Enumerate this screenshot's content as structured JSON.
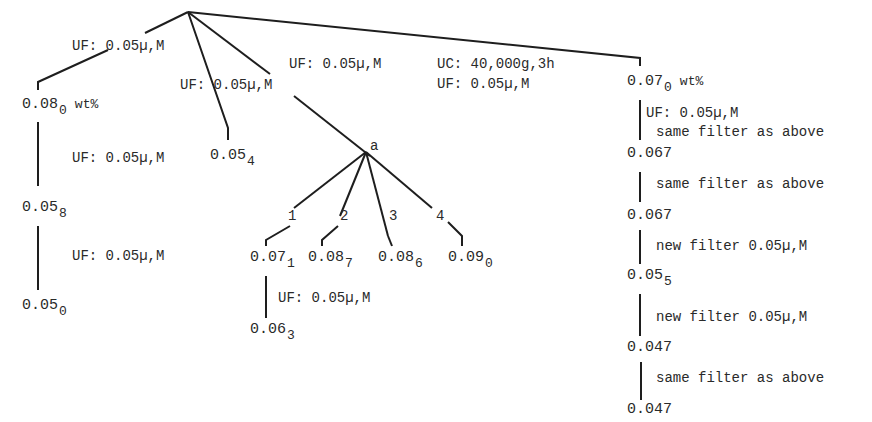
{
  "diagram": {
    "type": "fractionation-tree",
    "root": {
      "branches": [
        {
          "label": "UF: 0.05µ,M",
          "result": {
            "main": "0.08",
            "sub": "0",
            "unit": "wt%"
          }
        },
        {
          "label": "UF: 0.05µ,M",
          "result": {
            "main": "0.05",
            "sub": "4"
          }
        },
        {
          "label": "UF: 0.05µ,M",
          "result": {
            "main": "a"
          }
        },
        {
          "label": "UF: 0.05µ,M",
          "result": {
            "main": "0.07",
            "sub": "0",
            "unit": "wt%"
          }
        }
      ]
    },
    "labels": {
      "left_top": "UF: 0.05µ,M",
      "mid_left": "UF: 0.05µ,M",
      "mid_top": "UF: 0.05µ,M",
      "uc_line1": "UC: 40,000g,3h",
      "uc_line2": "UF: 0.05µ,M",
      "left_step1": "UF: 0.05µ,M",
      "left_step2": "UF: 0.05µ,M",
      "a_child1_step": "UF: 0.05µ,M",
      "right_step1_line1": "UF: 0.05µ,M",
      "right_step1_line2": "same filter as above",
      "right_step2": "same filter as above",
      "right_step3": "new filter 0.05µ,M",
      "right_step4": "new filter 0.05µ,M",
      "right_step5": "same filter as above"
    },
    "node_a": {
      "label": "a",
      "branch_numbers": [
        "1",
        "2",
        "3",
        "4"
      ],
      "children": [
        {
          "main": "0.07",
          "sub": "1"
        },
        {
          "main": "0.08",
          "sub": "7"
        },
        {
          "main": "0.08",
          "sub": "6"
        },
        {
          "main": "0.09",
          "sub": "0"
        }
      ],
      "child1_next": {
        "main": "0.06",
        "sub": "3"
      }
    },
    "left_chain": [
      {
        "main": "0.08",
        "sub": "0",
        "unit": "wt%"
      },
      {
        "main": "0.05",
        "sub": "8"
      },
      {
        "main": "0.05",
        "sub": "0"
      }
    ],
    "mid_value": {
      "main": "0.05",
      "sub": "4"
    },
    "right_chain": [
      {
        "main": "0.07",
        "sub": "0",
        "unit": "wt%"
      },
      {
        "main": "0.067"
      },
      {
        "main": "0.067"
      },
      {
        "main": "0.05",
        "sub": "5"
      },
      {
        "main": "0.047"
      },
      {
        "main": "0.047"
      }
    ]
  }
}
